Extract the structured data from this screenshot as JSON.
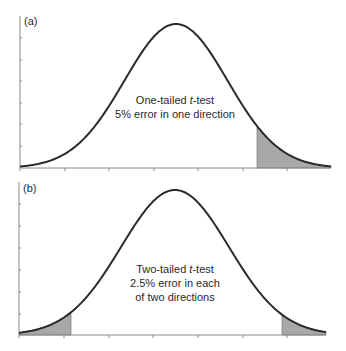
{
  "chart_data": [
    {
      "type": "area",
      "panel_label": "(a)",
      "title": "One-tailed t-test",
      "annotation_lines": [
        "One-tailed t-test",
        "5% error in one direction"
      ],
      "distribution": "normal",
      "xlabel": "",
      "ylabel": "",
      "x_ticks_count": 7,
      "y_ticks_count": 7,
      "tick_labels": [],
      "shaded_regions": [
        {
          "tail": "upper",
          "error_percent": 5
        }
      ],
      "colors": {
        "curve": "#2b2b2b",
        "shade": "#a8a8a8",
        "axis": "#8a8a8a"
      }
    },
    {
      "type": "area",
      "panel_label": "(b)",
      "title": "Two-tailed t-test",
      "annotation_lines": [
        "Two-tailed t-test",
        "2.5% error in each",
        "of two directions"
      ],
      "distribution": "normal",
      "xlabel": "",
      "ylabel": "",
      "x_ticks_count": 7,
      "y_ticks_count": 7,
      "tick_labels": [],
      "shaded_regions": [
        {
          "tail": "lower",
          "error_percent": 2.5
        },
        {
          "tail": "upper",
          "error_percent": 2.5
        }
      ],
      "colors": {
        "curve": "#2b2b2b",
        "shade": "#a8a8a8",
        "axis": "#8a8a8a"
      }
    }
  ],
  "layout": {
    "panels": [
      {
        "axisX": 20,
        "top": 16,
        "base": 168,
        "right": 331,
        "mean": 176,
        "sigma": 51.6,
        "peakY": 24,
        "xticks": [
          20,
          65,
          109,
          154,
          198,
          243,
          287
        ],
        "yticks": [
          38,
          60,
          81,
          103,
          124,
          146
        ],
        "shade": [
          [
            257,
            331
          ]
        ],
        "labelPos": [
          24,
          25
        ],
        "textX": 175,
        "textY": [
          104,
          118
        ]
      },
      {
        "axisX": 19,
        "top": 182,
        "base": 335,
        "right": 326,
        "mean": 175,
        "sigma": 54,
        "peakY": 190,
        "xticks": [
          19,
          64,
          109,
          153,
          198,
          243,
          287
        ],
        "yticks": [
          204,
          226,
          248,
          270,
          292,
          314
        ],
        "shade": [
          [
            19,
            71
          ],
          [
            282,
            326
          ]
        ],
        "labelPos": [
          23,
          192
        ],
        "textX": 175,
        "textY": [
          273,
          287,
          301
        ]
      }
    ]
  }
}
